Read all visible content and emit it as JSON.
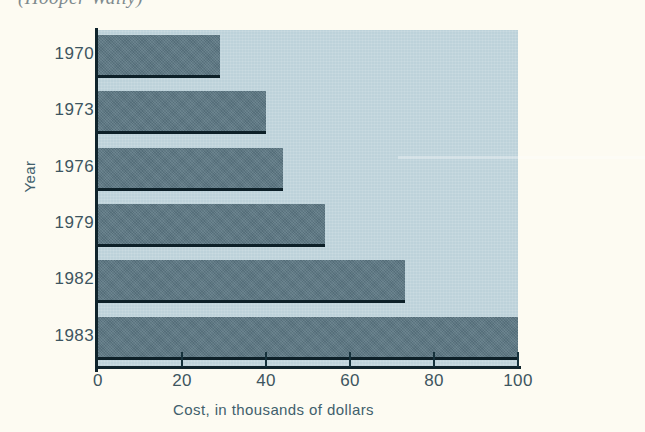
{
  "page": {
    "background_color": "#fdfbf2",
    "clipped_caption": "(Hooper Wally)"
  },
  "colors": {
    "bar": "#5d7884",
    "plot_background": "#bdd2da",
    "axis_line": "#10242c",
    "text": "#3d5560",
    "axis_title_text": "#41606c"
  },
  "chart_data": {
    "type": "bar",
    "orientation": "horizontal",
    "title": "",
    "xlabel": "Cost, in thousands of dollars",
    "ylabel": "Year",
    "categories": [
      "1970",
      "1973",
      "1976",
      "1979",
      "1982",
      "1983"
    ],
    "values": [
      29,
      40,
      44,
      54,
      73,
      100
    ],
    "xlim": [
      0,
      100
    ],
    "xticks": [
      0,
      20,
      40,
      60,
      80,
      100
    ],
    "xtick_labels": [
      "0",
      "20",
      "40",
      "60",
      "80",
      "100"
    ],
    "grid": false,
    "legend": null,
    "legend_position": "none",
    "units": "thousands of dollars"
  }
}
